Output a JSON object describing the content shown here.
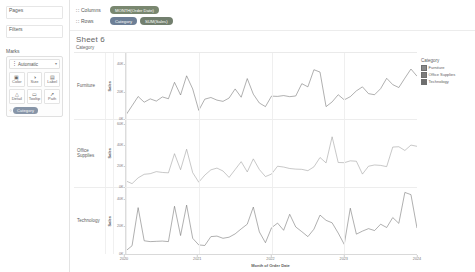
{
  "left_panel": {
    "pages_label": "Pages",
    "filters_label": "Filters",
    "marks": {
      "title": "Marks",
      "mark_type": "Automatic",
      "mark_type_icon": "line-chart-icon",
      "caret": "▾",
      "buttons": [
        {
          "label": "Color",
          "icon": "color-palette-icon",
          "glyph": "▣"
        },
        {
          "label": "Size",
          "icon": "size-icon",
          "glyph": "◑"
        },
        {
          "label": "Label",
          "icon": "label-icon",
          "glyph": "▤"
        },
        {
          "label": "Detail",
          "icon": "detail-icon",
          "glyph": "△"
        },
        {
          "label": "Tooltip",
          "icon": "tooltip-icon",
          "glyph": "▭"
        },
        {
          "label": "Path",
          "icon": "path-icon",
          "glyph": "↗"
        }
      ],
      "pill": {
        "label": "Category",
        "icon": "color-pill-icon",
        "glyph": "⁘"
      }
    }
  },
  "shelves": {
    "columns_label": "Columns",
    "rows_label": "Rows",
    "grip_glyph": "∷",
    "columns_pills": [
      {
        "label": "MONTH(Order Date)",
        "type": "green"
      }
    ],
    "rows_pills": [
      {
        "label": "Category",
        "type": "blue"
      },
      {
        "label": "SUM(Sales)",
        "type": "green"
      }
    ]
  },
  "worksheet": {
    "title": "Sheet 6",
    "category_header": "Category"
  },
  "legend": {
    "title": "Category",
    "items": [
      {
        "label": "Furniture",
        "color": "#8a8a8a"
      },
      {
        "label": "Office Supplies",
        "color": "#7c7c7c"
      },
      {
        "label": "Technology",
        "color": "#6e6e6e"
      }
    ]
  },
  "chart_data": {
    "type": "line",
    "title": "Sheet 6",
    "xlabel": "Month of Order Date",
    "ylabel": "Sales",
    "grid": true,
    "legend_position": "right",
    "x_tick_labels": [
      "2020",
      "2021",
      "2022",
      "2023",
      "2024"
    ],
    "x_tick_positions": [
      0,
      12,
      24,
      36,
      48
    ],
    "x": [
      "2020-01",
      "2020-02",
      "2020-03",
      "2020-04",
      "2020-05",
      "2020-06",
      "2020-07",
      "2020-08",
      "2020-09",
      "2020-10",
      "2020-11",
      "2020-12",
      "2021-01",
      "2021-02",
      "2021-03",
      "2021-04",
      "2021-05",
      "2021-06",
      "2021-07",
      "2021-08",
      "2021-09",
      "2021-10",
      "2021-11",
      "2021-12",
      "2022-01",
      "2022-02",
      "2022-03",
      "2022-04",
      "2022-05",
      "2022-06",
      "2022-07",
      "2022-08",
      "2022-09",
      "2022-10",
      "2022-11",
      "2022-12",
      "2023-01",
      "2023-02",
      "2023-03",
      "2023-04",
      "2023-05",
      "2023-06",
      "2023-07",
      "2023-08",
      "2023-09",
      "2023-10",
      "2023-11",
      "2023-12",
      "2024-01"
    ],
    "panels": [
      {
        "category": "Furniture",
        "row_label": "Furniture",
        "axis_title": "Sales",
        "ylim": [
          0,
          48000
        ],
        "y_ticks": [
          0,
          20000,
          40000
        ],
        "y_tick_labels": [
          "0K",
          "20K",
          "40K"
        ],
        "color": "#6e6e6e",
        "values": [
          3200,
          9800,
          16500,
          12400,
          14800,
          13200,
          16200,
          14900,
          26800,
          17600,
          31500,
          22000,
          6500,
          14600,
          15800,
          13900,
          13000,
          15400,
          22000,
          16000,
          29500,
          18200,
          11800,
          9200,
          16800,
          16600,
          17200,
          16400,
          16900,
          25800,
          23500,
          35900,
          34200,
          9200,
          12600,
          17800,
          14100,
          16400,
          20600,
          23500,
          18600,
          17800,
          22200,
          29700,
          25100,
          23000,
          29800,
          36400,
          31200
        ]
      },
      {
        "category": "Office Supplies",
        "row_label": "Office Supplies",
        "axis_title": "Sales",
        "ylim": [
          0,
          64000
        ],
        "y_ticks": [
          0,
          20000,
          40000,
          60000
        ],
        "y_tick_labels": [
          "0K",
          "20K",
          "40K",
          "60K"
        ],
        "color": "#9a9a9a",
        "values": [
          5200,
          2600,
          8200,
          11600,
          12200,
          14200,
          13400,
          13000,
          31500,
          16000,
          35800,
          13200,
          4000,
          10800,
          15900,
          17600,
          14800,
          8600,
          16200,
          23800,
          13900,
          26500,
          16200,
          9400,
          11800,
          19400,
          18600,
          17200,
          16600,
          16400,
          15100,
          18800,
          27800,
          22600,
          47800,
          23000,
          22800,
          24600,
          24200,
          11800,
          19400,
          20600,
          20200,
          19000,
          37900,
          38200,
          34600,
          39800,
          38600
        ]
      },
      {
        "category": "Technology",
        "row_label": "Technology",
        "axis_title": "Sales",
        "ylim": [
          0,
          48000
        ],
        "y_ticks": [
          0,
          20000,
          40000
        ],
        "y_tick_labels": [
          "0K",
          "20K",
          "40K"
        ],
        "color": "#6e6e6e",
        "values": [
          2600,
          6200,
          33800,
          9800,
          9200,
          9400,
          9600,
          9200,
          34800,
          13600,
          35600,
          11600,
          6800,
          6400,
          12800,
          13200,
          11600,
          12400,
          14800,
          18400,
          21800,
          34200,
          16200,
          8400,
          19200,
          22600,
          17400,
          29000,
          19800,
          16400,
          12800,
          18200,
          28400,
          24600,
          22800,
          15400,
          7200,
          33400,
          14600,
          16800,
          18600,
          17200,
          21800,
          19400,
          26600,
          22400,
          44800,
          43200,
          19000
        ]
      }
    ]
  }
}
